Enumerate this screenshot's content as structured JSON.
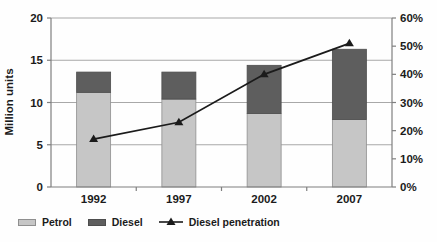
{
  "chart_data": {
    "type": "bar",
    "subtype": "stacked-bars-with-line-overlay",
    "categories": [
      "1992",
      "1997",
      "2002",
      "2007"
    ],
    "series": [
      {
        "name": "Petrol",
        "type": "bar",
        "stacked": true,
        "values": [
          11.2,
          10.4,
          8.7,
          8.0
        ],
        "color": "#c6c6c6",
        "border_color": "#8f8f8f"
      },
      {
        "name": "Diesel",
        "type": "bar",
        "stacked": true,
        "values": [
          2.4,
          3.2,
          5.7,
          8.3
        ],
        "color": "#5e5e5e",
        "border_color": "#4d4d4d"
      },
      {
        "name": "Diesel penetration",
        "type": "line",
        "axis": "right",
        "unit": "%",
        "values": [
          17,
          23,
          40,
          51
        ],
        "color": "#1b1b1b",
        "marker": "triangle"
      }
    ],
    "bar_totals": [
      13.6,
      13.6,
      14.4,
      16.3
    ],
    "left_axis": {
      "label": "Million units",
      "min": 0,
      "max": 20,
      "tick_values": [
        0,
        5,
        10,
        15,
        20
      ],
      "tick_labels": [
        "0",
        "5",
        "10",
        "15",
        "20"
      ]
    },
    "right_axis": {
      "min": 0,
      "max": 60,
      "tick_labels": [
        "0%",
        "10%",
        "20%",
        "30%",
        "40%",
        "50%",
        "60%"
      ]
    },
    "grid": "horizontal",
    "legend_position": "bottom-left",
    "colors": {
      "text": "#1b1b1b",
      "grid": "#a8a8a8",
      "axis": "#7f7f7f",
      "background": "#fefefe"
    }
  }
}
